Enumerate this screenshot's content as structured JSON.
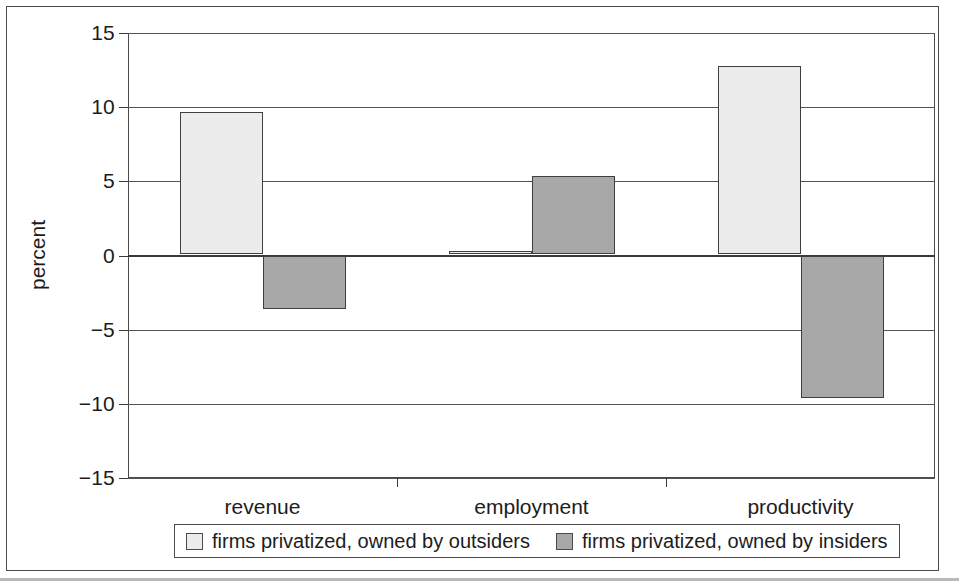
{
  "chart_data": {
    "type": "bar",
    "title": "",
    "subtitle": "",
    "xlabel": "",
    "ylabel": "percent",
    "categories": [
      "revenue",
      "employment",
      "productivity"
    ],
    "series": [
      {
        "name": "firms privatized, owned by outsiders",
        "color": "#ececec",
        "values": [
          9.6,
          0.25,
          12.7
        ]
      },
      {
        "name": "firms privatized, owned by insiders",
        "color": "#a8a8a8",
        "values": [
          -3.6,
          5.3,
          -9.6
        ]
      }
    ],
    "ylim": [
      -15,
      15
    ],
    "yticks": [
      15,
      10,
      5,
      0,
      -5,
      -10,
      -15
    ],
    "ytick_labels": [
      "15",
      "10",
      "5",
      "0",
      "−5",
      "−10",
      "−15"
    ],
    "grid": true,
    "grid_axis": "y",
    "legend_position": "bottom",
    "zero_line": 0
  },
  "axis": {
    "y_title": "percent"
  },
  "legend": {
    "items": [
      {
        "label": "firms privatized, owned by outsiders",
        "swatch": "light-gray-swatch"
      },
      {
        "label": "firms privatized, owned by insiders",
        "swatch": "dark-gray-swatch"
      }
    ]
  }
}
